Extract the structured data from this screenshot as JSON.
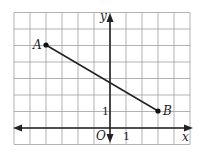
{
  "diagram": {
    "type": "coordinate-plane",
    "grid": {
      "x_min": -6,
      "x_max": 5,
      "y_min": -1,
      "y_max": 7,
      "unit_px_x": 16,
      "unit_px_y": 16.5,
      "origin_px": [
        110,
        128
      ]
    },
    "axes": {
      "x_label": "x",
      "y_label": "y",
      "origin_label": "O",
      "x_tick_label": "1",
      "y_tick_label": "1"
    },
    "points": [
      {
        "name": "A",
        "x": -4,
        "y": 5
      },
      {
        "name": "B",
        "x": 3,
        "y": 1
      }
    ],
    "segment": {
      "from": "A",
      "to": "B"
    },
    "colors": {
      "grid": "#9a9a9a",
      "axis": "#222222",
      "segment": "#222222"
    }
  }
}
